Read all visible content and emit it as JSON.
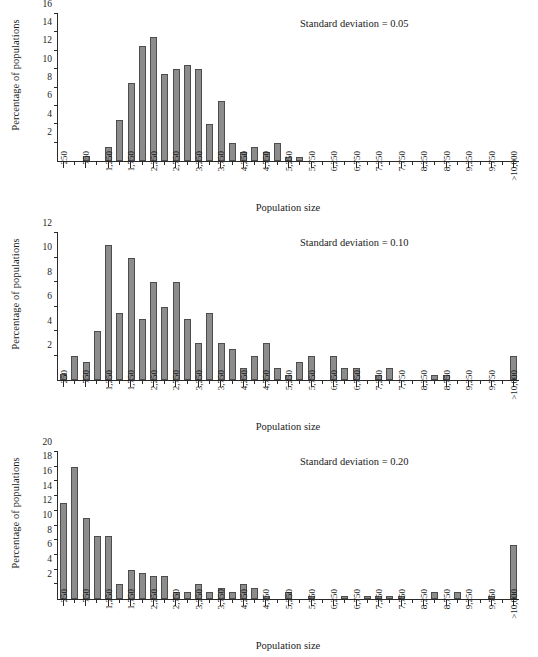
{
  "figure": {
    "axis_x_title": "Population size",
    "axis_y_title": "Percentage of populations",
    "bar_color": "#8c8c8c",
    "bar_edge_color": "#4d4d4d",
    "axis_color": "#2a2a2a"
  },
  "categories": [
    "250",
    "750",
    "1,250",
    "1,750",
    "2,250",
    "2,750",
    "3,250",
    "3,750",
    "4,250",
    "4,750",
    "5,250",
    "5,750",
    "6,250",
    "6,750",
    "7,250",
    "7,750",
    "8,250",
    "8,750",
    "9,250",
    "9,750",
    ">10,000"
  ],
  "panels": [
    {
      "id": "panel-sd-005",
      "annotation": "Standard deviation = 0.05",
      "ylim": [
        0,
        16
      ],
      "yticks": [
        2,
        4,
        6,
        8,
        10,
        12,
        14,
        16
      ]
    },
    {
      "id": "panel-sd-010",
      "annotation": "Standard deviation = 0.10",
      "ylim": [
        0,
        12
      ],
      "yticks": [
        2,
        4,
        6,
        8,
        10,
        12
      ]
    },
    {
      "id": "panel-sd-020",
      "annotation": "Standard deviation = 0.20",
      "ylim": [
        0,
        20
      ],
      "yticks": [
        2,
        4,
        6,
        8,
        10,
        12,
        14,
        16,
        18,
        20
      ]
    }
  ],
  "chart_data": [
    {
      "type": "bar",
      "title": "Standard deviation = 0.05",
      "xlabel": "Population size",
      "ylabel": "Percentage of populations",
      "ylim": [
        0,
        16
      ],
      "yticks": [
        2,
        4,
        6,
        8,
        10,
        12,
        14,
        16
      ],
      "grid": false,
      "legend": "none",
      "bin_width": 250,
      "bin_centers": [
        250,
        500,
        750,
        1000,
        1250,
        1500,
        1750,
        2000,
        2250,
        2500,
        2750,
        3000,
        3250,
        3500,
        3750,
        4000,
        4250,
        4500,
        4750,
        5000,
        5250,
        5500,
        5750,
        6000,
        6250,
        6500,
        6750,
        7000,
        7250,
        7500,
        7750,
        8000,
        8250,
        8500,
        8750,
        9000,
        9250,
        9500,
        9750,
        10000,
        ">10,000"
      ],
      "values": [
        0,
        0,
        0.5,
        0,
        1.5,
        4.5,
        8.5,
        12.5,
        13.5,
        9.5,
        10,
        10.5,
        10,
        4,
        6.5,
        2,
        1,
        1.5,
        1,
        2,
        0.4,
        0.4,
        0,
        0,
        0,
        0,
        0,
        0,
        0,
        0,
        0,
        0,
        0,
        0,
        0,
        0,
        0,
        0,
        0,
        0,
        0
      ],
      "tick_labels": [
        "250",
        "750",
        "1,250",
        "1,750",
        "2,250",
        "2,750",
        "3,250",
        "3,750",
        "4,250",
        "4,750",
        "5,250",
        "5,750",
        "6,250",
        "6,750",
        "7,250",
        "7,750",
        "8,250",
        "8,750",
        "9,250",
        "9,750",
        ">10,000"
      ]
    },
    {
      "type": "bar",
      "title": "Standard deviation = 0.10",
      "xlabel": "Population size",
      "ylabel": "Percentage of populations",
      "ylim": [
        0,
        12
      ],
      "yticks": [
        2,
        4,
        6,
        8,
        10,
        12
      ],
      "grid": false,
      "legend": "none",
      "bin_width": 250,
      "bin_centers": [
        250,
        500,
        750,
        1000,
        1250,
        1500,
        1750,
        2000,
        2250,
        2500,
        2750,
        3000,
        3250,
        3500,
        3750,
        4000,
        4250,
        4500,
        4750,
        5000,
        5250,
        5500,
        5750,
        6000,
        6250,
        6500,
        6750,
        7000,
        7250,
        7500,
        7750,
        8000,
        8250,
        8500,
        8750,
        9000,
        9250,
        9500,
        9750,
        10000,
        ">10,000"
      ],
      "values": [
        0.5,
        2,
        1.5,
        4,
        11,
        5.5,
        10,
        5,
        8,
        6,
        8,
        5,
        3,
        5.5,
        3,
        2.5,
        1,
        2,
        3,
        1,
        0.4,
        1.5,
        2,
        0,
        2,
        1,
        1,
        0,
        0.4,
        1,
        0,
        0,
        0,
        0.4,
        0.4,
        0,
        0,
        0,
        0,
        0,
        2
      ],
      "tick_labels": [
        "250",
        "750",
        "1,250",
        "1,750",
        "2,250",
        "2,750",
        "3,250",
        "3,750",
        "4,250",
        "4,750",
        "5,250",
        "5,750",
        "6,250",
        "6,750",
        "7,250",
        "7,750",
        "8,250",
        "8,750",
        "9,250",
        "9,750",
        ">10,000"
      ]
    },
    {
      "type": "bar",
      "title": "Standard deviation = 0.20",
      "xlabel": "Population size",
      "ylabel": "Percentage of populations",
      "ylim": [
        0,
        20
      ],
      "yticks": [
        2,
        4,
        6,
        8,
        10,
        12,
        14,
        16,
        18,
        20
      ],
      "grid": false,
      "legend": "none",
      "bin_width": 250,
      "bin_centers": [
        250,
        500,
        750,
        1000,
        1250,
        1500,
        1750,
        2000,
        2250,
        2500,
        2750,
        3000,
        3250,
        3500,
        3750,
        4000,
        4250,
        4500,
        4750,
        5000,
        5250,
        5500,
        5750,
        6000,
        6250,
        6500,
        6750,
        7000,
        7250,
        7500,
        7750,
        8000,
        8250,
        8500,
        8750,
        9000,
        9250,
        9500,
        9750,
        10000,
        ">10,000"
      ],
      "values": [
        13,
        18,
        11,
        8.6,
        8.6,
        2,
        4,
        3.5,
        3.1,
        3.1,
        1,
        1,
        2,
        1,
        1.5,
        1,
        2,
        1.5,
        0.4,
        0,
        1,
        0,
        0.4,
        0,
        0,
        0.4,
        0,
        0.4,
        0.4,
        0.4,
        0.4,
        0,
        0,
        1,
        0,
        1,
        0,
        0,
        0.4,
        0,
        7.3
      ],
      "tick_labels": [
        "250",
        "750",
        "1,250",
        "1,750",
        "2,250",
        "2,750",
        "3,250",
        "3,750",
        "4,250",
        "4,750",
        "5,250",
        "5,750",
        "6,250",
        "6,750",
        "7,250",
        "7,750",
        "8,250",
        "8,750",
        "9,250",
        "9,750",
        ">10,000"
      ]
    }
  ]
}
